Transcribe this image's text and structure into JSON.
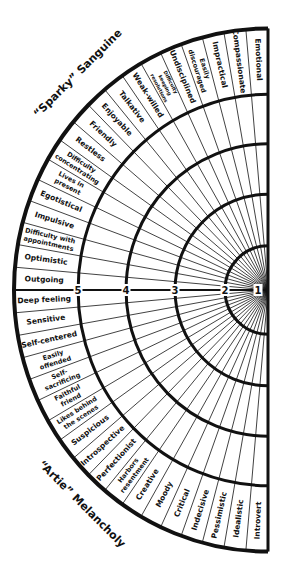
{
  "titles": {
    "top": "“Sparky” Sanguine",
    "bottom": "“Artie” Melancholy"
  },
  "scale": {
    "ring_numbers": [
      "1",
      "2",
      "3",
      "4",
      "5"
    ]
  },
  "colors": {
    "ink": "#111111",
    "paper": "#ffffff"
  },
  "segments": [
    {
      "lines": [
        "Emotional"
      ]
    },
    {
      "lines": [
        "Compassionate"
      ]
    },
    {
      "lines": [
        "Impractical"
      ]
    },
    {
      "lines": [
        "Easily",
        "discouraged"
      ]
    },
    {
      "lines": [
        "Undisciplined"
      ]
    },
    {
      "lines": [
        "Difficulty",
        "keeping",
        "resolutions"
      ]
    },
    {
      "lines": [
        "Weak-willed"
      ]
    },
    {
      "lines": [
        "Talkative"
      ]
    },
    {
      "lines": [
        "Enjoyable"
      ]
    },
    {
      "lines": [
        "Friendly"
      ]
    },
    {
      "lines": [
        "Restless"
      ]
    },
    {
      "lines": [
        "Difficulty",
        "concentrating"
      ]
    },
    {
      "lines": [
        "Lives in",
        "present"
      ]
    },
    {
      "lines": [
        "Egotistical"
      ]
    },
    {
      "lines": [
        "Impulsive"
      ]
    },
    {
      "lines": [
        "Difficulty with",
        "appointments"
      ]
    },
    {
      "lines": [
        "Optimistic"
      ]
    },
    {
      "lines": [
        "Outgoing"
      ]
    },
    {
      "lines": [
        "Deep feeling"
      ]
    },
    {
      "lines": [
        "Sensitive"
      ]
    },
    {
      "lines": [
        "Self-centered"
      ]
    },
    {
      "lines": [
        "Easily",
        "offended"
      ]
    },
    {
      "lines": [
        "Self-",
        "sacrificing"
      ]
    },
    {
      "lines": [
        "Faithful",
        "friend"
      ]
    },
    {
      "lines": [
        "Likes behind",
        "the scenes"
      ]
    },
    {
      "lines": [
        "Suspicious"
      ]
    },
    {
      "lines": [
        "Introspective"
      ]
    },
    {
      "lines": [
        "Perfectionist"
      ]
    },
    {
      "lines": [
        "Harbors",
        "resentment"
      ]
    },
    {
      "lines": [
        "Creative"
      ]
    },
    {
      "lines": [
        "Moody"
      ]
    },
    {
      "lines": [
        "Critical"
      ]
    },
    {
      "lines": [
        "Indecisive"
      ]
    },
    {
      "lines": [
        "Pessimistic"
      ]
    },
    {
      "lines": [
        "Idealistic"
      ]
    },
    {
      "lines": [
        "Introvert"
      ]
    }
  ]
}
